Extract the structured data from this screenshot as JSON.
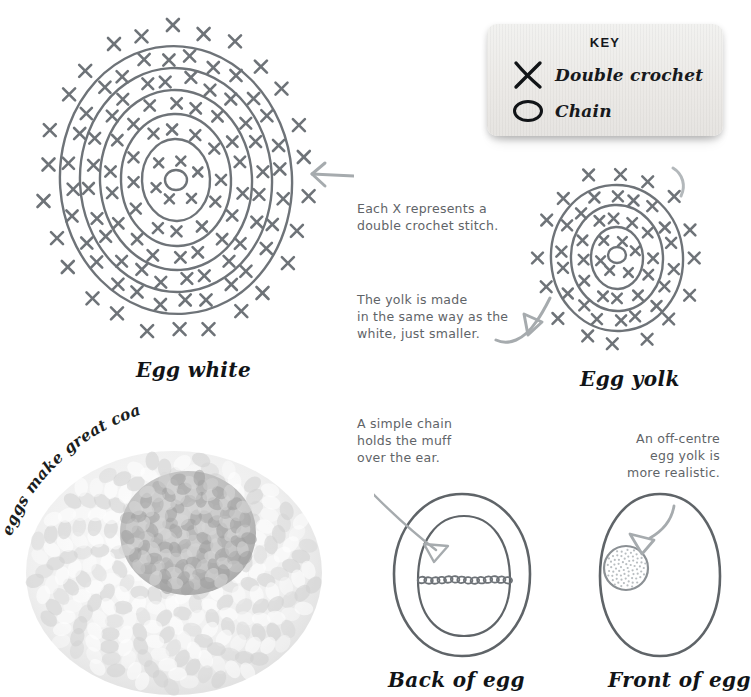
{
  "page": {
    "background": "#ffffff",
    "width": 729,
    "height": 697
  },
  "key": {
    "title": "KEY",
    "items": [
      {
        "icon": "cross-x-icon",
        "label": "Double crochet"
      },
      {
        "icon": "oval-chain-icon",
        "label": "Chain"
      }
    ]
  },
  "diagrams": {
    "egg_white": {
      "title": "Egg white",
      "rings": 5,
      "has_center_ring": true,
      "arrow": "left-pointing-arrow"
    },
    "egg_yolk": {
      "title": "Egg yolk",
      "rings": 3,
      "has_center_ring": true,
      "arrow": "curved-up-right-arrow"
    },
    "back_of_egg": {
      "title": "Back of egg",
      "arrow": "down-right-pointing-arrow"
    },
    "front_of_egg": {
      "title": "Front of egg",
      "arrow": "curved-down-left-arrow"
    }
  },
  "notes": {
    "stitch_note": "Each X represents a\ndouble crochet stitch.",
    "yolk_note": "The yolk is made\nin the same way as the\nwhite, just smaller.",
    "chain_note": "A simple chain\nholds the muff\nover the ear.",
    "offcentre_note": "An off-centre\negg yolk is\nmore realistic."
  },
  "photo": {
    "caption": "eggs make great coasters",
    "alt_name": "crocheted-egg-coaster-photo"
  },
  "colors": {
    "ink": "#5f6468",
    "title_ink": "#111417",
    "diagram_line": "#6e7378",
    "arrow": "#9aa0a4",
    "key_bg": "#efedea"
  }
}
